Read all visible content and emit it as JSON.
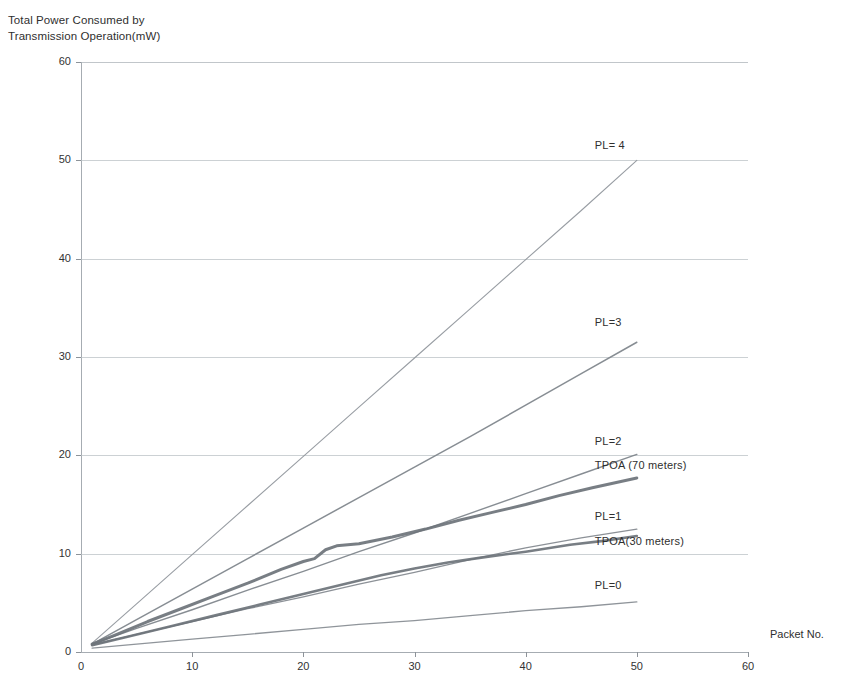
{
  "chart_data": {
    "type": "line",
    "title": "",
    "ylabel": "Total Power Consumed by\nTransmission Operation(mW)",
    "xlabel": "Packet No.",
    "xlim": [
      0,
      60
    ],
    "ylim": [
      0,
      60
    ],
    "x_ticks": [
      0,
      10,
      20,
      30,
      40,
      50,
      60
    ],
    "y_ticks": [
      0,
      10,
      20,
      30,
      40,
      50,
      60
    ],
    "grid": "horizontal",
    "legend_position": "inline-annotations",
    "series": [
      {
        "name": "PL= 4",
        "label_x": 50,
        "label_y": 51.4,
        "color": "#8f959b",
        "width": 1.1,
        "x": [
          1,
          5,
          10,
          15,
          20,
          25,
          30,
          35,
          40,
          45,
          50
        ],
        "values": [
          0.9,
          4.9,
          9.9,
          14.9,
          19.9,
          24.9,
          29.9,
          34.9,
          39.9,
          44.9,
          50.0
        ]
      },
      {
        "name": "PL=3",
        "label_x": 50,
        "label_y": 33.4,
        "color": "#7d838a",
        "width": 1.5,
        "x": [
          1,
          5,
          10,
          15,
          20,
          25,
          30,
          35,
          40,
          45,
          50
        ],
        "values": [
          0.8,
          3.3,
          6.4,
          9.5,
          12.6,
          15.7,
          18.8,
          21.9,
          25.1,
          28.3,
          31.5
        ]
      },
      {
        "name": "PL=2",
        "label_x": 50,
        "label_y": 21.3,
        "color": "#7d838a",
        "width": 1.4,
        "x": [
          1,
          5,
          10,
          15,
          20,
          25,
          30,
          35,
          40,
          45,
          50
        ],
        "values": [
          0.8,
          2.4,
          4.3,
          6.3,
          8.2,
          10.2,
          12.1,
          14.1,
          16.1,
          18.1,
          20.1
        ]
      },
      {
        "name": "TPOA (70 meters)",
        "label_x": 50,
        "label_y": 18.8,
        "color": "#6d7379",
        "width": 3.0,
        "x": [
          1,
          3,
          6,
          9,
          12,
          15,
          18,
          20,
          21,
          22,
          23,
          25,
          28,
          31,
          34,
          37,
          40,
          43,
          46,
          50
        ],
        "values": [
          0.8,
          1.7,
          3.1,
          4.4,
          5.7,
          7.0,
          8.4,
          9.2,
          9.5,
          10.4,
          10.8,
          11.0,
          11.7,
          12.5,
          13.4,
          14.2,
          15.0,
          15.9,
          16.7,
          17.7
        ]
      },
      {
        "name": "PL=1",
        "label_x": 50,
        "label_y": 13.6,
        "color": "#82888e",
        "width": 1.3,
        "x": [
          1,
          5,
          10,
          15,
          20,
          25,
          30,
          35,
          40,
          45,
          50
        ],
        "values": [
          0.7,
          1.8,
          3.1,
          4.4,
          5.6,
          6.9,
          8.1,
          9.4,
          10.6,
          11.6,
          12.5
        ]
      },
      {
        "name": "TPOA(30 meters)",
        "label_x": 50,
        "label_y": 11.1,
        "color": "#6d7379",
        "width": 2.6,
        "x": [
          1,
          4,
          8,
          12,
          16,
          20,
          24,
          27,
          30,
          33,
          36,
          40,
          44,
          47,
          50
        ],
        "values": [
          0.7,
          1.5,
          2.6,
          3.7,
          4.8,
          5.9,
          7.0,
          7.8,
          8.5,
          9.1,
          9.6,
          10.2,
          10.9,
          11.3,
          11.8
        ]
      },
      {
        "name": "PL=0",
        "label_x": 50,
        "label_y": 6.6,
        "color": "#858b91",
        "width": 1.3,
        "x": [
          1,
          5,
          10,
          15,
          20,
          25,
          30,
          35,
          40,
          45,
          50
        ],
        "values": [
          0.4,
          0.8,
          1.3,
          1.8,
          2.3,
          2.8,
          3.2,
          3.7,
          4.2,
          4.6,
          5.1
        ]
      }
    ]
  },
  "axes": {
    "y_title": "Total Power Consumed by\nTransmission Operation(mW)",
    "x_title": "Packet No.",
    "y_labels": [
      "60",
      "50",
      "40",
      "30",
      "20",
      "10",
      "0"
    ],
    "x_labels": [
      "0",
      "10",
      "20",
      "30",
      "40",
      "50",
      "60"
    ]
  },
  "colors": {
    "gridline": "#b9bfc4",
    "axis": "#a6acb2",
    "text": "#2f2f2f",
    "thick_series": "#6d7379",
    "thin_series": "#8f959b"
  }
}
